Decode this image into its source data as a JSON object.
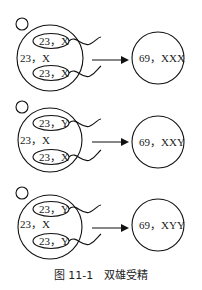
{
  "figure": {
    "caption": "图 11-1　双雄受精",
    "rows": [
      {
        "egg_label": "23，X",
        "sperm_top": "23，X",
        "sperm_bottom": "23，X",
        "zygote_label": "69，XXX"
      },
      {
        "egg_label": "23，X",
        "sperm_top": "23，Y",
        "sperm_bottom": "23，X",
        "zygote_label": "69，XXY"
      },
      {
        "egg_label": "23，X",
        "sperm_top": "23，Y",
        "sperm_bottom": "23，Y",
        "zygote_label": "69，XYY"
      }
    ]
  }
}
